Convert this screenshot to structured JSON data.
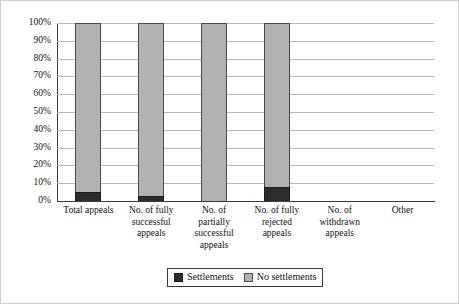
{
  "chart_data": {
    "type": "bar",
    "subtype": "stacked-bar-100-percent",
    "title": "",
    "xlabel": "",
    "ylabel": "",
    "ylim": [
      0,
      100
    ],
    "yticks": [
      "0%",
      "10%",
      "20%",
      "30%",
      "40%",
      "50%",
      "60%",
      "70%",
      "80%",
      "90%",
      "100%"
    ],
    "ytick_values": [
      0,
      10,
      20,
      30,
      40,
      50,
      60,
      70,
      80,
      90,
      100
    ],
    "grid": true,
    "legend_position": "bottom-center",
    "categories": [
      "Total appeals",
      "No. of fully successful appeals",
      "No. of partially successful appeals",
      "No. of fully rejected appeals",
      "No. of withdrawn appeals",
      "Other"
    ],
    "category_lines": [
      [
        "Total appeals"
      ],
      [
        "No. of fully",
        "successful",
        "appeals"
      ],
      [
        "No. of",
        "partially",
        "successful",
        "appeals"
      ],
      [
        "No. of fully",
        "rejected",
        "appeals"
      ],
      [
        "No. of",
        "withdrawn",
        "appeals"
      ],
      [
        "Other"
      ]
    ],
    "series": [
      {
        "name": "Settlements",
        "color": "#2c2c2c",
        "values": [
          5,
          3,
          0,
          8,
          null,
          null
        ]
      },
      {
        "name": "No settlements",
        "color": "#b2b2b2",
        "values": [
          95,
          97,
          100,
          92,
          null,
          null
        ]
      }
    ]
  },
  "legend": {
    "entries": [
      {
        "label": "Settlements",
        "swatch": "dark-swatch-icon"
      },
      {
        "label": "No settlements",
        "swatch": "gray-swatch-icon"
      }
    ]
  },
  "colors": {
    "settlements": "#2c2c2c",
    "no_settlements": "#b2b2b2",
    "gridline": "#b9b9b9",
    "axis": "#3a3a3a",
    "background": "#ffffff"
  }
}
